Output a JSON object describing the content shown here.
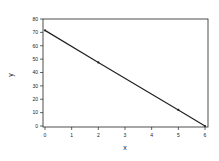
{
  "chart_data": {
    "type": "line",
    "title": "",
    "xlabel": "x",
    "ylabel": "y",
    "xlim": [
      0,
      6
    ],
    "ylim": [
      0,
      80
    ],
    "xticks": [
      0,
      1,
      2,
      3,
      4,
      5,
      6
    ],
    "yticks": [
      0,
      10,
      20,
      30,
      40,
      50,
      60,
      70,
      80
    ],
    "grid": false,
    "legend": null,
    "series": [
      {
        "name": "y",
        "x": [
          0,
          2,
          5,
          6
        ],
        "y": [
          71.5,
          47.5,
          12,
          0
        ],
        "color": "#222222",
        "marker": "dot"
      }
    ]
  },
  "colors": {
    "line": "#222222",
    "axes": "#222222",
    "background": "#ffffff"
  }
}
